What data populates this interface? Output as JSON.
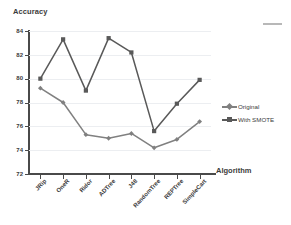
{
  "chart_data": {
    "type": "line",
    "title": "",
    "ylabel": "Accuracy",
    "xlabel": "Algorithm",
    "categories": [
      "JRip",
      "OneR",
      "Ridor",
      "ADTree",
      "J48",
      "RandomTree",
      "REPTree",
      "SimpleCart"
    ],
    "series": [
      {
        "name": "Original",
        "color": "#808080",
        "marker": "diamond",
        "values": [
          79.2,
          78.0,
          75.3,
          75.0,
          75.4,
          74.2,
          74.9,
          76.4
        ]
      },
      {
        "name": "With SMOTE",
        "color": "#595959",
        "marker": "square",
        "values": [
          80.0,
          83.3,
          79.0,
          83.4,
          82.2,
          75.6,
          77.9,
          79.9
        ]
      }
    ],
    "ylim": [
      72,
      84
    ],
    "yticks": [
      72,
      74,
      76,
      78,
      80,
      82,
      84
    ],
    "ytick_labels": [
      "72",
      "74",
      "76",
      "78",
      "80",
      "82",
      "84"
    ],
    "grid": true,
    "grid_color": "#eceef1",
    "legend_position": "right",
    "axis_color": "#4a4a4a",
    "background": "#ffffff"
  },
  "legend": {
    "entries": [
      {
        "label": "Original"
      },
      {
        "label": "With SMOTE"
      }
    ]
  }
}
